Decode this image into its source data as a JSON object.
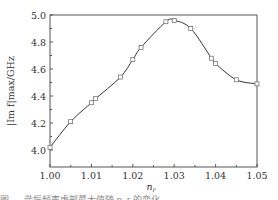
{
  "chart_data": {
    "type": "line",
    "title": "",
    "xlabel": "n_r",
    "ylabel": "|Im f|_max / GHz",
    "xlim": [
      1.0,
      1.05
    ],
    "ylim": [
      3.89,
      5.0
    ],
    "xticks": [
      "1.00",
      "1.01",
      "1.02",
      "1.03",
      "1.04",
      "1.05"
    ],
    "yticks": [
      "4.0",
      "4.2",
      "4.4",
      "4.6",
      "4.8",
      "5.0"
    ],
    "grid": false,
    "legend": null,
    "series": [
      {
        "name": "|Im f|max",
        "marker": "open-square",
        "line": "smooth-solid",
        "x": [
          1.0,
          1.005,
          1.01,
          1.011,
          1.017,
          1.02,
          1.022,
          1.028,
          1.03,
          1.034,
          1.039,
          1.04,
          1.045,
          1.05
        ],
        "y": [
          4.02,
          4.21,
          4.35,
          4.38,
          4.54,
          4.67,
          4.76,
          4.95,
          4.96,
          4.9,
          4.68,
          4.64,
          4.52,
          4.49
        ]
      }
    ]
  },
  "labels": {
    "xlabel_main": "n",
    "xlabel_sub": "r",
    "ylabel_text": "|Im f|max/GHz"
  },
  "caption": "图 … 谐振频率虚部最大值随 n_r 的变化"
}
